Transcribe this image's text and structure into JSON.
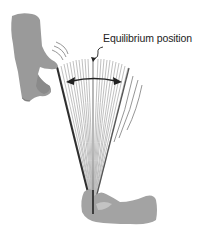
{
  "diagram": {
    "label": "Equilibrium position",
    "elements": {
      "top_hand": "hand-pulling-blade-tip",
      "bottom_hand": "hand-clamping-blade-base",
      "blade": "vibrating-flexible-blade",
      "fan_lines": "blade-oscillation-positions",
      "double_arrow": "oscillation-range-arrow",
      "center_line": "equilibrium-line"
    },
    "colors": {
      "hand": "#9a9a9a",
      "hand_shadow": "#7d7d7d",
      "blade_dark": "#333333",
      "fan_lines": "#b5b5b5",
      "arrow": "#222222",
      "text": "#222222"
    }
  }
}
